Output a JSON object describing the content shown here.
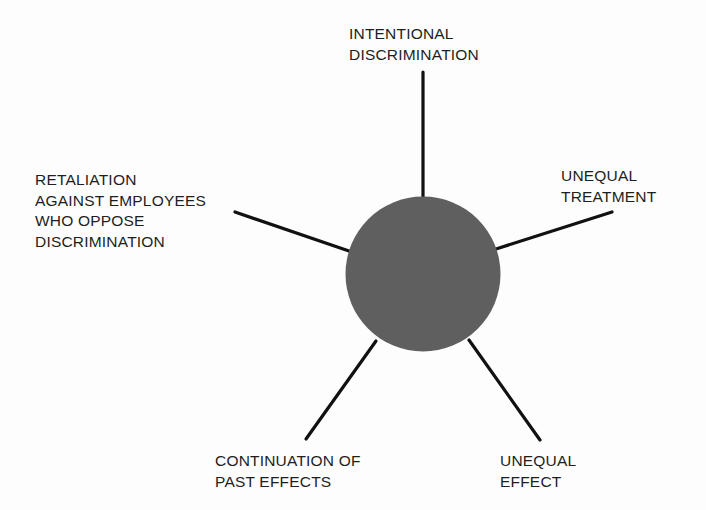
{
  "diagram": {
    "type": "hub-and-spoke",
    "center": {
      "label": "",
      "color": "#5f5f5f"
    },
    "line_color": "#111111",
    "spokes": [
      {
        "id": "intentional-discrimination",
        "lines": [
          "INTENTIONAL",
          "DISCRIMINATION"
        ],
        "position": "top"
      },
      {
        "id": "unequal-treatment",
        "lines": [
          "UNEQUAL",
          "TREATMENT"
        ],
        "position": "upper-right"
      },
      {
        "id": "unequal-effect",
        "lines": [
          "UNEQUAL",
          "EFFECT"
        ],
        "position": "lower-right"
      },
      {
        "id": "continuation-of-past-effects",
        "lines": [
          "CONTINUATION OF",
          "PAST EFFECTS"
        ],
        "position": "lower-left"
      },
      {
        "id": "retaliation",
        "lines": [
          "RETALIATION",
          "AGAINST EMPLOYEES",
          "WHO OPPOSE",
          "DISCRIMINATION"
        ],
        "position": "upper-left"
      }
    ]
  }
}
